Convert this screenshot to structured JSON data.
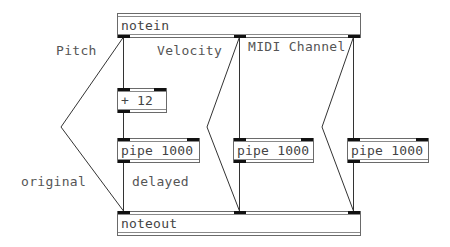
{
  "patch": {
    "objects": {
      "notein": {
        "text": "notein"
      },
      "plus12": {
        "text": "+ 12"
      },
      "pipe_left": {
        "text": "pipe 1000"
      },
      "pipe_mid": {
        "text": "pipe 1000"
      },
      "pipe_right": {
        "text": "pipe 1000"
      },
      "noteout": {
        "text": "noteout"
      }
    },
    "comments": {
      "pitch": "Pitch",
      "velocity": "Velocity",
      "midi_channel": "MIDI Channel",
      "original": "original",
      "delayed": "delayed"
    },
    "colors": {
      "background": "#ffffff",
      "wire": "#333333",
      "port": "#111111",
      "box_border": "#6a6a6a",
      "text": "#444444"
    }
  }
}
